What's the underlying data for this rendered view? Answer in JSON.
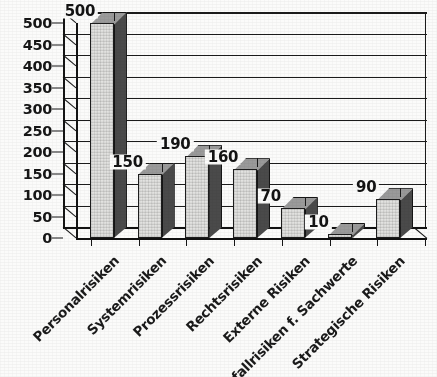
{
  "chart_data": {
    "type": "bar",
    "title": "",
    "subtitle": "",
    "xlabel": "",
    "ylabel": "",
    "categories": [
      "Personalrisiken",
      "Systemrisiken",
      "Prozessrisiken",
      "Rechtsrisiken",
      "Externe Risiken",
      "Ausfallrisiken f. Sachwerte",
      "Strategische Risiken"
    ],
    "values": [
      500,
      150,
      190,
      160,
      70,
      10,
      90
    ],
    "data_labels": [
      "500",
      "150",
      "190",
      "160",
      "70",
      "10",
      "90"
    ],
    "ylim": [
      0,
      500
    ],
    "ytick_values": [
      0,
      50,
      100,
      150,
      200,
      250,
      300,
      350,
      400,
      450,
      500
    ],
    "ytick_labels": [
      "0",
      "50",
      "100",
      "150",
      "200",
      "250",
      "300",
      "350",
      "400",
      "450",
      "500"
    ],
    "ytick_step": 50,
    "grid": true,
    "grid_axis": "y",
    "legend": false,
    "legend_entries": [],
    "series": [
      {
        "name": "Risikoarten",
        "values": [
          500,
          150,
          190,
          160,
          70,
          10,
          90
        ]
      }
    ],
    "style": {
      "three_d": true,
      "bar_face_color": "#e2e2e0",
      "bar_side_color": "#4a4a4a",
      "bar_top_color": "#9a9a9a",
      "line_color": "#1b1b1b",
      "text_color": "#161616",
      "background_color": "#fbfbfa"
    },
    "annotations": []
  },
  "figure": {
    "caption": ""
  }
}
